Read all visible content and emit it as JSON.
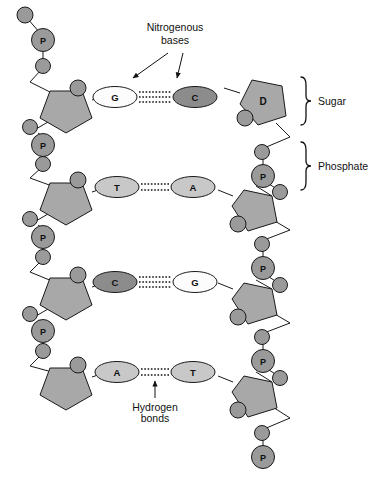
{
  "diagram": {
    "annotations": {
      "nitrogenous_bases": {
        "line1": "Nitrogenous",
        "line2": "bases"
      },
      "hydrogen_bonds": {
        "line1": "Hydrogen",
        "line2": "bonds"
      },
      "sugar": "Sugar",
      "phosphate": "Phosphate"
    },
    "colors": {
      "background": "#ffffff",
      "outline": "#1a1a1a",
      "circle_fill": "#9a9a9a",
      "pentagon_fill": "#a8a8a8",
      "base_dark_fill": "#8c8c8c",
      "base_light_fill": "#fcfcfc",
      "base_mid_fill": "#c8c8c8",
      "text": "#111111"
    },
    "phosphate_letter": "P",
    "sugar_letter": "D",
    "rungs": [
      {
        "index": 1,
        "left_base": "G",
        "left_base_shade": "light",
        "right_base": "C",
        "right_base_shade": "dark",
        "hydrogen_bond_count": 3,
        "y": 97
      },
      {
        "index": 2,
        "left_base": "T",
        "left_base_shade": "mid",
        "right_base": "A",
        "right_base_shade": "mid",
        "hydrogen_bond_count": 2,
        "y": 187
      },
      {
        "index": 3,
        "left_base": "C",
        "left_base_shade": "dark",
        "right_base": "G",
        "right_base_shade": "light",
        "hydrogen_bond_count": 3,
        "y": 282
      },
      {
        "index": 4,
        "left_base": "A",
        "left_base_shade": "mid",
        "right_base": "T",
        "right_base_shade": "mid",
        "hydrogen_bond_count": 2,
        "y": 372
      }
    ],
    "left_phosphates": [
      {
        "label": "P",
        "x": 43,
        "y": 40
      },
      {
        "label": "P",
        "x": 43,
        "y": 140
      },
      {
        "label": "P",
        "x": 43,
        "y": 232
      },
      {
        "label": "P",
        "x": 43,
        "y": 326
      }
    ],
    "right_phosphates": [
      {
        "label": "P",
        "x": 263,
        "y": 176
      },
      {
        "label": "P",
        "x": 263,
        "y": 268
      },
      {
        "label": "P",
        "x": 263,
        "y": 361
      },
      {
        "label": "P",
        "x": 263,
        "y": 457
      }
    ],
    "brackets": [
      {
        "label": "Sugar",
        "x": 305,
        "y_top": 77,
        "y_bottom": 125,
        "label_x": 320,
        "label_y": 104
      },
      {
        "label": "Phosphate",
        "x": 305,
        "y_top": 142,
        "y_bottom": 190,
        "label_x": 320,
        "label_y": 169
      }
    ]
  }
}
